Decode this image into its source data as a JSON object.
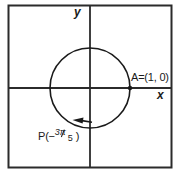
{
  "figure": {
    "background_color": "#ffffff",
    "ink_color": "#1a1a1a"
  },
  "axes": {
    "x_label": "x",
    "y_label": "y",
    "origin": {
      "x": 90,
      "y": 88
    }
  },
  "frame": {
    "left": 8,
    "top": 5,
    "right": 172,
    "bottom": 168
  },
  "circle": {
    "center_x": 90,
    "center_y": 88,
    "radius": 40,
    "stroke_color": "#1a1a1a"
  },
  "points": [
    {
      "name": "A",
      "label": "A=(1, 0)",
      "marker_x": 130,
      "marker_y": 88,
      "coordinates": "(1, 0)"
    },
    {
      "name": "P",
      "label_prefix": "P(−",
      "label_numerator": "3π",
      "label_denominator": "5",
      "label_suffix": ")",
      "angle_radians": "-3π/5"
    }
  ],
  "arrow": {
    "name": "clockwise-direction-arrow",
    "direction": "clockwise",
    "tip_x": 74,
    "tip_y": 120
  }
}
